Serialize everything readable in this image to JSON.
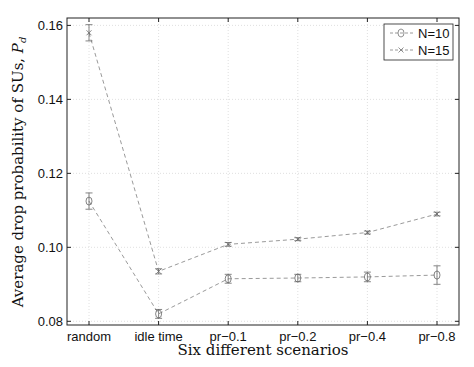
{
  "chart_data": {
    "type": "line",
    "title": "",
    "xlabel": "Six different scenarios",
    "ylabel": "Average drop probability of SUs, P_d",
    "ylabel_main": "Average drop probability of SUs, ",
    "ylabel_symbol": "P",
    "ylabel_sub": "d",
    "categories": [
      "random",
      "idle time",
      "pr−0.1",
      "pr−0.2",
      "pr−0.4",
      "pr−0.8"
    ],
    "ylim": [
      0.079,
      0.162
    ],
    "yticks": [
      0.08,
      0.1,
      0.12,
      0.14,
      0.16
    ],
    "ytick_labels": [
      "0.08",
      "0.10",
      "0.12",
      "0.14",
      "0.16"
    ],
    "grid": true,
    "legend_position": "upper right",
    "series": [
      {
        "name": "N=10",
        "marker": "circle",
        "line_style": "dashed",
        "values": [
          0.1125,
          0.082,
          0.0915,
          0.0917,
          0.092,
          0.0925
        ],
        "error": [
          0.0022,
          0.0012,
          0.0012,
          0.001,
          0.0013,
          0.0025
        ]
      },
      {
        "name": "N=15",
        "marker": "x",
        "line_style": "dashed",
        "values": [
          0.158,
          0.0935,
          0.1008,
          0.1022,
          0.104,
          0.109
        ],
        "error": [
          0.0022,
          0.0007,
          0.0005,
          0.0004,
          0.0004,
          0.0005
        ]
      }
    ]
  },
  "legend": {
    "items": [
      {
        "label": "N=10"
      },
      {
        "label": "N=15"
      }
    ]
  },
  "colors": {
    "series_line": "#9a9a9a",
    "axis": "#222222",
    "grid": "#d8d8d8"
  }
}
